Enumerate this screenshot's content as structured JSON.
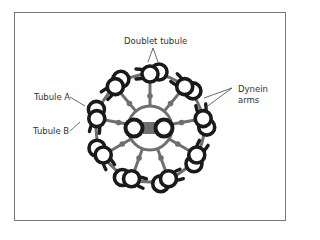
{
  "figure": {
    "labels": {
      "doublet_tubule": "Doublet tubule",
      "tubule_a": "Tubule A",
      "tubule_b": "Tubule B",
      "dynein_arms_line1": "Dynein",
      "dynein_arms_line2": "arms"
    },
    "structure": {
      "outer_doublets": 9,
      "central_singlets": 2
    },
    "colors": {
      "tubule": "#1a1a1a",
      "spoke": "#6f6f6f",
      "frame": "#777777",
      "text": "#333333"
    }
  }
}
